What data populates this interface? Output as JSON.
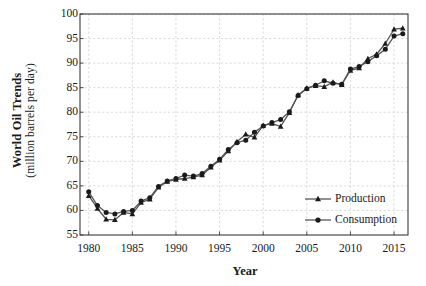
{
  "chart_data": {
    "type": "line",
    "title": "",
    "ylabel_bold": "World Oil Trends",
    "ylabel_sub": "(million barrels per day)",
    "xlabel": "Year",
    "xlim": [
      1979,
      2016.6
    ],
    "ylim": [
      55,
      100
    ],
    "yticks": [
      55,
      60,
      65,
      70,
      75,
      80,
      85,
      90,
      95,
      100
    ],
    "xticks": [
      1980,
      1985,
      1990,
      1995,
      2000,
      2005,
      2010,
      2015
    ],
    "ytick_labels": [
      "55",
      "60",
      "65",
      "70",
      "75",
      "80",
      "85",
      "90",
      "95",
      "100"
    ],
    "xtick_labels": [
      "1980",
      "1985",
      "1990",
      "1995",
      "2000",
      "2005",
      "2010",
      "2015"
    ],
    "grid": true,
    "grid_style": "dashed",
    "grid_color": "#cfcfcf",
    "axis_color": "#3a3a3a",
    "legend_position": "inside-lower-right",
    "x": [
      1980,
      1981,
      1982,
      1983,
      1984,
      1985,
      1986,
      1987,
      1988,
      1989,
      1990,
      1991,
      1992,
      1993,
      1994,
      1995,
      1996,
      1997,
      1998,
      1999,
      2000,
      2001,
      2002,
      2003,
      2004,
      2005,
      2006,
      2007,
      2008,
      2009,
      2010,
      2011,
      2012,
      2013,
      2014,
      2015,
      2016
    ],
    "series": [
      {
        "name": "Production",
        "marker": "triangle",
        "color": "#1a1a1a",
        "values": [
          63.0,
          60.4,
          58.2,
          58.1,
          59.6,
          59.3,
          61.6,
          62.3,
          64.7,
          65.9,
          66.3,
          66.5,
          66.8,
          67.2,
          68.8,
          70.2,
          72.1,
          74.0,
          75.5,
          74.9,
          77.3,
          77.7,
          77.1,
          79.9,
          83.5,
          84.9,
          85.4,
          85.2,
          86.1,
          85.6,
          88.5,
          89.0,
          90.9,
          91.8,
          94.0,
          96.9,
          97.1
        ]
      },
      {
        "name": "Consumption",
        "marker": "circle",
        "color": "#1a1a1a",
        "values": [
          63.8,
          61.0,
          59.6,
          59.3,
          59.8,
          60.0,
          61.9,
          62.6,
          64.9,
          66.0,
          66.5,
          67.2,
          67.0,
          67.5,
          69.0,
          70.4,
          72.4,
          73.8,
          74.3,
          75.9,
          77.2,
          77.9,
          78.5,
          80.1,
          83.4,
          84.8,
          85.5,
          86.4,
          85.9,
          85.7,
          88.8,
          89.3,
          90.3,
          91.5,
          92.8,
          95.5,
          96.0
        ]
      }
    ]
  },
  "legend": {
    "items": [
      {
        "label": "Production",
        "marker": "triangle"
      },
      {
        "label": "Consumption",
        "marker": "circle"
      }
    ]
  }
}
